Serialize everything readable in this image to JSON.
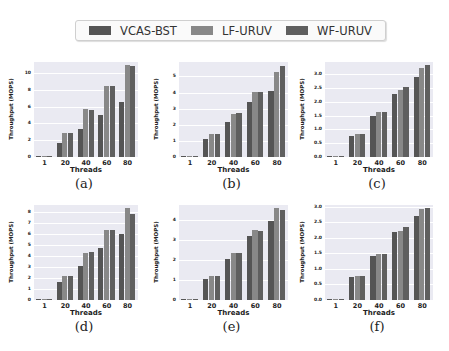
{
  "legend": {
    "items": [
      {
        "label": "VCAS-BST",
        "color": "#555555"
      },
      {
        "label": "LF-URUV",
        "color": "#888888"
      },
      {
        "label": "WF-URUV",
        "color": "#5f5f5f"
      }
    ]
  },
  "colors": {
    "plot_bg": "#eaeaf2",
    "grid": "#ffffff"
  },
  "chart_data": [
    {
      "type": "bar",
      "caption": "(a)",
      "xlabel": "Threads",
      "ylabel": "Throughput (MOPS)",
      "categories": [
        "1",
        "20",
        "40",
        "60",
        "80"
      ],
      "yticks": [
        0,
        2,
        4,
        6,
        8,
        10
      ],
      "ytick_labels": [
        "0",
        "2",
        "4",
        "6",
        "8",
        "10"
      ],
      "ylim": [
        0,
        11.3
      ],
      "series": [
        {
          "name": "VCAS-BST",
          "values": [
            0.05,
            1.7,
            3.3,
            5.0,
            6.5
          ]
        },
        {
          "name": "LF-URUV",
          "values": [
            0.05,
            2.8,
            5.7,
            8.5,
            11.0
          ]
        },
        {
          "name": "WF-URUV",
          "values": [
            0.05,
            2.8,
            5.6,
            8.5,
            10.8
          ]
        }
      ]
    },
    {
      "type": "bar",
      "caption": "(b)",
      "xlabel": "Threads",
      "ylabel": "Throughput (MOPS)",
      "categories": [
        "1",
        "20",
        "40",
        "60",
        "80"
      ],
      "yticks": [
        0,
        1,
        2,
        3,
        4,
        5
      ],
      "ytick_labels": [
        "0",
        "1",
        "2",
        "3",
        "4",
        "5"
      ],
      "ylim": [
        0,
        5.9
      ],
      "series": [
        {
          "name": "VCAS-BST",
          "values": [
            0.05,
            1.1,
            2.2,
            3.4,
            4.1
          ]
        },
        {
          "name": "LF-URUV",
          "values": [
            0.05,
            1.4,
            2.65,
            4.05,
            5.3
          ]
        },
        {
          "name": "WF-URUV",
          "values": [
            0.05,
            1.45,
            2.75,
            4.05,
            5.65
          ]
        }
      ]
    },
    {
      "type": "bar",
      "caption": "(c)",
      "xlabel": "Threads",
      "ylabel": "Throughput (MOPS)",
      "categories": [
        "1",
        "20",
        "40",
        "60",
        "80"
      ],
      "yticks": [
        0,
        0.5,
        1.0,
        1.5,
        2.0,
        2.5,
        3.0
      ],
      "ytick_labels": [
        "0.0",
        "0.5",
        "1.0",
        "1.5",
        "2.0",
        "2.5",
        "3.0"
      ],
      "ylim": [
        0,
        3.45
      ],
      "series": [
        {
          "name": "VCAS-BST",
          "values": [
            0.02,
            0.78,
            1.5,
            2.3,
            2.9
          ]
        },
        {
          "name": "LF-URUV",
          "values": [
            0.02,
            0.85,
            1.65,
            2.45,
            3.25
          ]
        },
        {
          "name": "WF-URUV",
          "values": [
            0.02,
            0.85,
            1.65,
            2.55,
            3.35
          ]
        }
      ]
    },
    {
      "type": "bar",
      "caption": "(d)",
      "xlabel": "Threads",
      "ylabel": "Throughput (MOPS)",
      "categories": [
        "1",
        "20",
        "40",
        "60",
        "80"
      ],
      "yticks": [
        0,
        1,
        2,
        3,
        4,
        5,
        6,
        7,
        8
      ],
      "ytick_labels": [
        "0",
        "1",
        "2",
        "3",
        "4",
        "5",
        "6",
        "7",
        "8"
      ],
      "ylim": [
        0,
        8.6
      ],
      "series": [
        {
          "name": "VCAS-BST",
          "values": [
            0.05,
            1.6,
            3.1,
            4.7,
            5.95
          ]
        },
        {
          "name": "LF-URUV",
          "values": [
            0.05,
            2.2,
            4.25,
            6.35,
            8.3
          ]
        },
        {
          "name": "WF-URUV",
          "values": [
            0.05,
            2.2,
            4.35,
            6.35,
            7.8
          ]
        }
      ]
    },
    {
      "type": "bar",
      "caption": "(e)",
      "xlabel": "Threads",
      "ylabel": "Throughput (MOPS)",
      "categories": [
        "1",
        "20",
        "40",
        "60",
        "80"
      ],
      "yticks": [
        0,
        1,
        2,
        3,
        4
      ],
      "ytick_labels": [
        "0",
        "1",
        "2",
        "3",
        "4"
      ],
      "ylim": [
        0,
        4.75
      ],
      "series": [
        {
          "name": "VCAS-BST",
          "values": [
            0.05,
            1.05,
            2.05,
            3.2,
            3.95
          ]
        },
        {
          "name": "LF-URUV",
          "values": [
            0.05,
            1.2,
            2.35,
            3.5,
            4.6
          ]
        },
        {
          "name": "WF-URUV",
          "values": [
            0.05,
            1.2,
            2.35,
            3.45,
            4.5
          ]
        }
      ]
    },
    {
      "type": "bar",
      "caption": "(f)",
      "xlabel": "Threads",
      "ylabel": "Throughput (MOPS)",
      "categories": [
        "1",
        "20",
        "40",
        "60",
        "80"
      ],
      "yticks": [
        0,
        0.5,
        1.0,
        1.5,
        2.0,
        2.5,
        3.0
      ],
      "ytick_labels": [
        "0.0",
        "0.5",
        "1.0",
        "1.5",
        "2.0",
        "2.5",
        "3.0"
      ],
      "ylim": [
        0,
        3.05
      ],
      "series": [
        {
          "name": "VCAS-BST",
          "values": [
            0.02,
            0.75,
            1.4,
            2.17,
            2.7
          ]
        },
        {
          "name": "LF-URUV",
          "values": [
            0.02,
            0.76,
            1.47,
            2.22,
            2.92
          ]
        },
        {
          "name": "WF-URUV",
          "values": [
            0.02,
            0.77,
            1.47,
            2.35,
            2.95
          ]
        }
      ]
    }
  ]
}
